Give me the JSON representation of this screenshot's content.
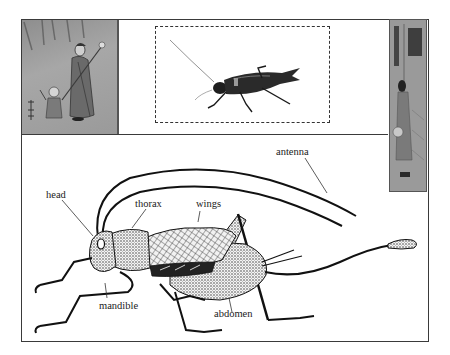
{
  "figure": {
    "top_left_image": {
      "description": "Japanese woodblock print: woman with staff and child",
      "icon": "woodblock-print-image"
    },
    "top_center_image": {
      "description": "Photograph of a black field cricket",
      "icon": "cricket-photo"
    },
    "top_right_image": {
      "description": "Tall narrow Japanese woodblock print",
      "icon": "woodblock-print-image"
    },
    "diagram": {
      "description": "Line illustration of a cricket with labeled body parts",
      "labels": {
        "head": "head",
        "thorax": "thorax",
        "wings": "wings",
        "antenna": "antenna",
        "mandible": "mandible",
        "abdomen": "abdomen"
      }
    }
  },
  "colors": {
    "frame": "#3a3a3a",
    "ink": "#1a1a1a",
    "background": "#ffffff"
  }
}
